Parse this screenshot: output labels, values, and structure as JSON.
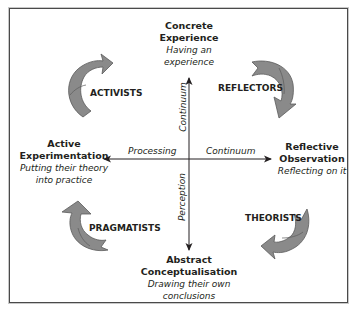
{
  "diagram": {
    "type": "learning-cycle",
    "poles": {
      "top": {
        "title_lines": [
          "Concrete",
          "Experience"
        ],
        "sub_lines": [
          "Having an",
          "experience"
        ]
      },
      "right": {
        "title_lines": [
          "Reflective",
          "Observation"
        ],
        "sub_lines": [
          "Reflecting on it"
        ]
      },
      "bottom": {
        "title_lines": [
          "Abstract",
          "Conceptualisation"
        ],
        "sub_lines": [
          "Drawing their own",
          "conclusions"
        ]
      },
      "left": {
        "title_lines": [
          "Active",
          "Experimentation"
        ],
        "sub_lines": [
          "Putting their theory",
          "into practice"
        ]
      }
    },
    "axes": {
      "horizontal": {
        "left_label": "Processing",
        "right_label": "Continuum"
      },
      "vertical": {
        "upper_label": "Continuum",
        "lower_label": "Perception"
      }
    },
    "learning_styles": {
      "top_left": "ACTIVISTS",
      "top_right": "REFLECTORS",
      "bottom_right": "THEORISTS",
      "bottom_left": "PRAGMATISTS"
    },
    "colors": {
      "arrow_fill": "#8a8a8a",
      "arrow_stroke": "#5a5a5a",
      "axis": "#231f20",
      "border": "#4a4a4a"
    }
  }
}
